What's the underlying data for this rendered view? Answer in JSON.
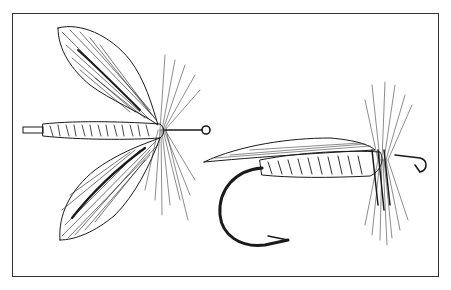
{
  "illustration": {
    "subject": "Two fishing flies, pen-and-ink drawing",
    "items": [
      {
        "name": "winged wet fly (top view, wings spread)"
      },
      {
        "name": "dry/wet fly on hook (side view)"
      }
    ],
    "colors": {
      "ink": "#1a1a1a",
      "paper": "#ffffff",
      "border": "#333333"
    }
  }
}
